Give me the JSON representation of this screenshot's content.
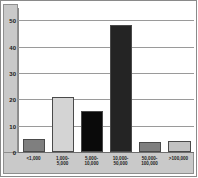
{
  "chart_data": {
    "type": "bar",
    "title": "",
    "subtitle": "",
    "xlabel": "",
    "ylabel": "",
    "categories": [
      "<1,000",
      "1,000-\n5,000",
      "5,000-\n10,000",
      "10,000-\n50,000",
      "50,000-\n100,000",
      ">100,000"
    ],
    "values": [
      5,
      21,
      15.5,
      48.5,
      4,
      4.3
    ],
    "bar_colors": [
      "#7f7f7f",
      "#d4d4d4",
      "#0a0a0a",
      "#242424",
      "#7f7f7f",
      "#c2c2c2"
    ],
    "ylim": [
      0,
      55
    ],
    "yticks": [
      0,
      10,
      20,
      30,
      40,
      50
    ],
    "ytick_labels": [
      "0",
      "10",
      "20",
      "30",
      "40",
      "50"
    ],
    "grid": true,
    "legend": "none"
  },
  "style": {
    "gutter_color": "#c9c9c9",
    "grid_color": "#9a9a9a",
    "frame_color": "#8a8a8a",
    "background": "#ffffff"
  }
}
